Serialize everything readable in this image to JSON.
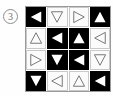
{
  "figure": {
    "item_label": "3",
    "item_label_shape": "circled-number",
    "grid": {
      "rows": 4,
      "cols": 4,
      "cells": [
        {
          "row": 1,
          "col": 1,
          "fill": "black",
          "triangle": "left",
          "triangle_style": "solid",
          "triangle_color": "#ffffff"
        },
        {
          "row": 1,
          "col": 2,
          "fill": "white",
          "triangle": "down",
          "triangle_style": "outline",
          "triangle_color": "#6b6b6b"
        },
        {
          "row": 1,
          "col": 3,
          "fill": "white",
          "triangle": "right",
          "triangle_style": "outline",
          "triangle_color": "#6b6b6b"
        },
        {
          "row": 1,
          "col": 4,
          "fill": "black",
          "triangle": "up",
          "triangle_style": "solid",
          "triangle_color": "#ffffff"
        },
        {
          "row": 2,
          "col": 1,
          "fill": "white",
          "triangle": "up",
          "triangle_style": "outline",
          "triangle_color": "#6b6b6b"
        },
        {
          "row": 2,
          "col": 2,
          "fill": "black",
          "triangle": "left",
          "triangle_style": "solid",
          "triangle_color": "#ffffff"
        },
        {
          "row": 2,
          "col": 3,
          "fill": "black",
          "triangle": "up",
          "triangle_style": "solid",
          "triangle_color": "#ffffff"
        },
        {
          "row": 2,
          "col": 4,
          "fill": "white",
          "triangle": "left",
          "triangle_style": "outline",
          "triangle_color": "#6b6b6b"
        },
        {
          "row": 3,
          "col": 1,
          "fill": "white",
          "triangle": "right",
          "triangle_style": "outline",
          "triangle_color": "#6b6b6b"
        },
        {
          "row": 3,
          "col": 2,
          "fill": "black",
          "triangle": "down",
          "triangle_style": "solid",
          "triangle_color": "#ffffff"
        },
        {
          "row": 3,
          "col": 3,
          "fill": "black",
          "triangle": "left",
          "triangle_style": "solid",
          "triangle_color": "#ffffff"
        },
        {
          "row": 3,
          "col": 4,
          "fill": "white",
          "triangle": "down",
          "triangle_style": "outline",
          "triangle_color": "#6b6b6b"
        },
        {
          "row": 4,
          "col": 1,
          "fill": "black",
          "triangle": "down",
          "triangle_style": "solid",
          "triangle_color": "#ffffff"
        },
        {
          "row": 4,
          "col": 2,
          "fill": "white",
          "triangle": "left",
          "triangle_style": "outline",
          "triangle_color": "#6b6b6b"
        },
        {
          "row": 4,
          "col": 3,
          "fill": "white",
          "triangle": "up",
          "triangle_style": "outline",
          "triangle_color": "#6b6b6b"
        },
        {
          "row": 4,
          "col": 4,
          "fill": "black",
          "triangle": "left",
          "triangle_style": "solid",
          "triangle_color": "#ffffff"
        }
      ]
    },
    "colors": {
      "background": "#fefefe",
      "cell_black": "#000000",
      "cell_white": "#fbfbfb",
      "grid_line": "#9a9a9a",
      "outline_triangle": "#6b6b6b",
      "solid_triangle": "#ffffff",
      "label_text": "#6f6f6f"
    }
  }
}
